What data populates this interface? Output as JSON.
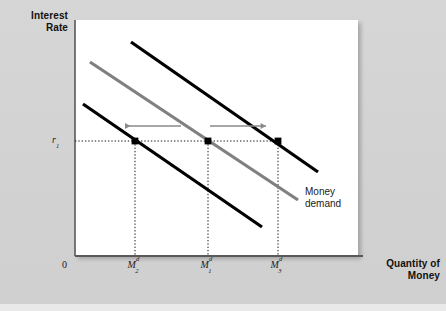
{
  "figure": {
    "background_color": "#d2d2d2",
    "panel_color": "#ffffff"
  },
  "axes": {
    "y_title": "Interest\nRate",
    "y_title_line1": "Interest",
    "y_title_line2": "Rate",
    "x_title_line1": "Quantity of",
    "x_title_line2": "Money",
    "origin_label": "0",
    "axis_color": "#595959"
  },
  "annotations": {
    "rate_label_base": "r",
    "rate_label_sub": "1",
    "curve_caption_line1": "Money",
    "curve_caption_line2": "demand",
    "arrow_color": "#8a8a8a",
    "leftward_arrow_meaning": "decrease in money demand",
    "rightward_arrow_meaning": "increase in money demand"
  },
  "chart_data": {
    "type": "line",
    "xlabel": "Quantity of Money",
    "ylabel": "Interest Rate",
    "grid": false,
    "legend_position": "inline-right",
    "xlim": [
      0,
      100
    ],
    "ylim": [
      0,
      100
    ],
    "x_ticks": [
      {
        "id": "M2d",
        "base": "M",
        "sub": "2",
        "sup": "d",
        "pixel_x": 135
      },
      {
        "id": "M1d",
        "base": "M",
        "sub": "1",
        "sup": "d",
        "pixel_x": 208
      },
      {
        "id": "M3d",
        "base": "M",
        "sub": "3",
        "sup": "d",
        "pixel_x": 278
      }
    ],
    "y_ticks": [
      {
        "id": "r1",
        "base": "r",
        "sub": "1",
        "pixel_y": 141
      }
    ],
    "series": [
      {
        "name": "Money demand (decreased)",
        "color": "#000000",
        "width": 3.2,
        "x1": 83,
        "y1": 104,
        "x2": 262,
        "y2": 227,
        "intersection_label": "M2d"
      },
      {
        "name": "Money demand (original)",
        "color": "#808080",
        "width": 3.2,
        "x1": 90,
        "y1": 62,
        "x2": 298,
        "y2": 200,
        "intersection_label": "M1d",
        "captioned": true
      },
      {
        "name": "Money demand (increased)",
        "color": "#000000",
        "width": 3.2,
        "x1": 131,
        "y1": 42,
        "x2": 318,
        "y2": 172,
        "intersection_label": "M3d"
      }
    ],
    "equilibrium_points": [
      {
        "label": "M2d",
        "pixel_x": 135,
        "pixel_y": 141
      },
      {
        "label": "M1d",
        "pixel_x": 208,
        "pixel_y": 141
      },
      {
        "label": "M3d",
        "pixel_x": 278,
        "pixel_y": 141
      }
    ],
    "shift_arrows": [
      {
        "direction": "left",
        "from_x": 181,
        "to_x": 125,
        "pixel_y": 126
      },
      {
        "direction": "right",
        "from_x": 210,
        "to_x": 266,
        "pixel_y": 126
      }
    ]
  }
}
